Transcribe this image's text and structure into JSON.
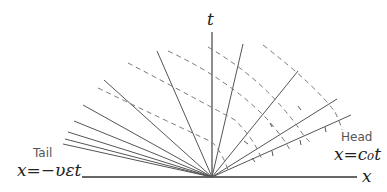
{
  "diagram": {
    "axes": {
      "x_label": "x",
      "t_label": "t"
    },
    "tail": {
      "label": "Tail",
      "equation": "x=−υεt"
    },
    "head": {
      "label": "Head",
      "equation": "x=c₀t"
    },
    "colors": {
      "solid": "#555555",
      "dashed": "#777777",
      "axis": "#333333"
    }
  }
}
